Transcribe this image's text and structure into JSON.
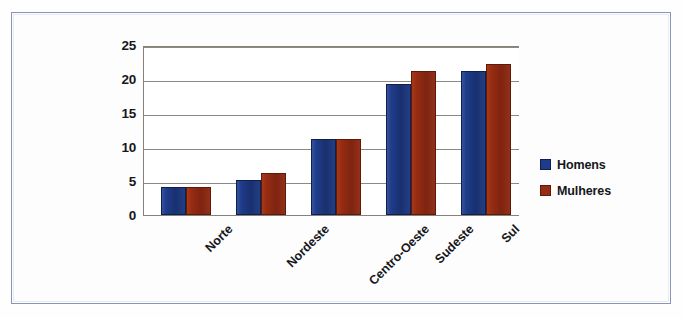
{
  "chart_data": {
    "type": "bar",
    "title": "",
    "xlabel": "",
    "ylabel": "",
    "categories": [
      "Norte",
      "Nordeste",
      "Centro-Oeste",
      "Sudeste",
      "Sul"
    ],
    "series": [
      {
        "name": "Homens",
        "color": "#1F3C8C",
        "values": [
          4.1,
          5.1,
          11.2,
          19.3,
          21.2
        ]
      },
      {
        "name": "Mulheres",
        "color": "#962C12",
        "values": [
          4.1,
          6.2,
          11.2,
          21.2,
          22.2
        ]
      }
    ],
    "ylim": [
      0,
      25
    ],
    "y_ticks": [
      0,
      5,
      10,
      15,
      20,
      25
    ],
    "y_tick_labels": [
      "0",
      "5",
      "10",
      "15",
      "20",
      "25"
    ],
    "grid": true,
    "legend_position": "right",
    "x_tick_rotation": -45
  },
  "legend": {
    "items": [
      {
        "label": "Homens",
        "swatch": "homens"
      },
      {
        "label": "Mulheres",
        "swatch": "mulheres"
      }
    ]
  }
}
